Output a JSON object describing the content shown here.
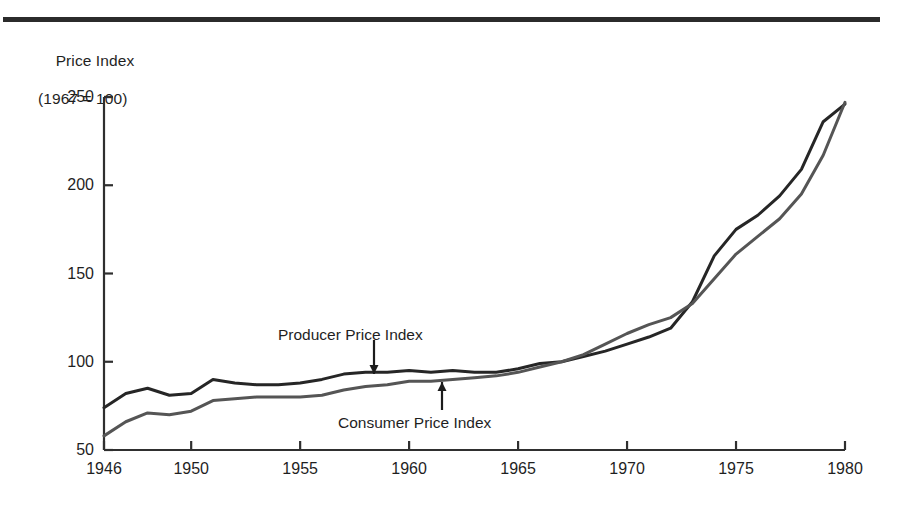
{
  "figure": {
    "top_rule": true,
    "background": "#ffffff"
  },
  "chart_data": {
    "type": "line",
    "title": "Price Index",
    "subtitle": "(1967 = 100)",
    "xlabel": "",
    "ylabel": "Price Index (1967 = 100)",
    "xlim": [
      1946,
      1980
    ],
    "ylim": [
      50,
      250
    ],
    "yticks": [
      50,
      100,
      150,
      200,
      250
    ],
    "ytick_labels": [
      "50",
      "100",
      "150",
      "200",
      "250"
    ],
    "xticks": [
      1946,
      1950,
      1955,
      1960,
      1965,
      1970,
      1975,
      1980
    ],
    "xtick_labels": [
      "1946",
      "1950",
      "1955",
      "1960",
      "1965",
      "1970",
      "1975",
      "1980"
    ],
    "grid": false,
    "legend": "annotations",
    "annotations": [
      {
        "text": "Producer Price Index",
        "points_to": "producer-series",
        "arrow": "down",
        "x_label": 278,
        "y_label": 327,
        "arrow_x": 374,
        "arrow_y_from": 340,
        "arrow_y_to": 374
      },
      {
        "text": "Consumer Price Index",
        "points_to": "consumer-series",
        "arrow": "up",
        "x_label": 338,
        "y_label": 415,
        "arrow_x": 442,
        "arrow_y_from": 410,
        "arrow_y_to": 382
      }
    ],
    "x": [
      1946,
      1947,
      1948,
      1949,
      1950,
      1951,
      1952,
      1953,
      1954,
      1955,
      1956,
      1957,
      1958,
      1959,
      1960,
      1961,
      1962,
      1963,
      1964,
      1965,
      1966,
      1967,
      1968,
      1969,
      1970,
      1971,
      1972,
      1973,
      1974,
      1975,
      1976,
      1977,
      1978,
      1979,
      1980
    ],
    "series": [
      {
        "name": "Producer Price Index",
        "color": "#262626",
        "width": 3.0,
        "values": [
          74,
          82,
          85,
          81,
          82,
          90,
          88,
          87,
          87,
          88,
          90,
          93,
          94,
          94,
          95,
          94,
          95,
          94,
          94,
          96,
          99,
          100,
          103,
          106,
          110,
          114,
          119,
          134,
          160,
          175,
          183,
          194,
          209,
          236,
          246
        ]
      },
      {
        "name": "Consumer Price Index",
        "color": "#555555",
        "width": 3.0,
        "values": [
          58,
          66,
          71,
          70,
          72,
          78,
          79,
          80,
          80,
          80,
          81,
          84,
          86,
          87,
          89,
          89,
          90,
          91,
          92,
          94,
          97,
          100,
          104,
          110,
          116,
          121,
          125,
          133,
          147,
          161,
          171,
          181,
          195,
          217,
          247
        ]
      }
    ]
  },
  "geometry": {
    "plot_left": 104,
    "plot_right": 845,
    "plot_top": 97,
    "plot_bottom": 450,
    "tick_len": 9
  }
}
